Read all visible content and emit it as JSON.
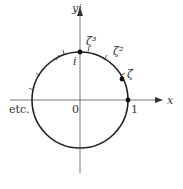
{
  "diagram": {
    "type": "unit-circle-roots-of-unity",
    "axes": {
      "x_label": "x",
      "y_label": "yi",
      "origin_label": "0"
    },
    "points": [
      {
        "label": "1",
        "angle_deg": 0
      },
      {
        "label": "ζ",
        "angle_deg": 30
      },
      {
        "label": "ζ²",
        "angle_deg": 60
      },
      {
        "label": "ζ³",
        "angle_deg": 90
      },
      {
        "label": "i",
        "angle_deg": 90
      }
    ],
    "continuation_label": "etc.",
    "colors": {
      "line": "#222222",
      "axis": "#555555"
    }
  }
}
